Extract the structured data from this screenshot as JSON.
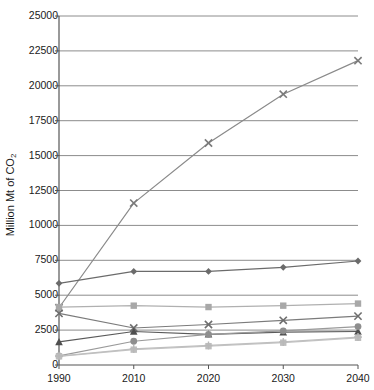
{
  "chart_data": {
    "type": "line",
    "title": "",
    "xlabel": "",
    "ylabel": "Million Mt of CO2",
    "ylabel_rich": "Million Mt of CO₂",
    "categories": [
      "1990",
      "2010",
      "2020",
      "2030",
      "2040"
    ],
    "x": [
      1990,
      2010,
      2020,
      2030,
      2040
    ],
    "ylim": [
      0,
      25000
    ],
    "ytick_labels": [
      "0",
      "2500",
      "5000",
      "7500",
      "10000",
      "12500",
      "15000",
      "17500",
      "20000",
      "22500",
      "25000"
    ],
    "ytick_values": [
      0,
      2500,
      5000,
      7500,
      10000,
      12500,
      15000,
      17500,
      20000,
      22500,
      25000
    ],
    "grid": true,
    "grid_axis": "y",
    "legend": "none",
    "legend_position": "none",
    "series": [
      {
        "name": "series-x-rising",
        "marker": "x",
        "color": "#7a7a7a",
        "line_color": "#8a8a8a",
        "values": [
          4100,
          11600,
          15900,
          19400,
          21800
        ]
      },
      {
        "name": "series-diamond",
        "marker": "diamond",
        "color": "#6b6b6b",
        "line_color": "#6b6b6b",
        "values": [
          5850,
          6700,
          6700,
          7000,
          7450
        ]
      },
      {
        "name": "series-square-light",
        "marker": "square",
        "color": "#a8a8a8",
        "line_color": "#b0b0b0",
        "values": [
          4150,
          4250,
          4150,
          4250,
          4400
        ]
      },
      {
        "name": "series-x-lower",
        "marker": "x",
        "color": "#6e6e6e",
        "line_color": "#7b7b7b",
        "values": [
          3700,
          2650,
          2900,
          3200,
          3500
        ]
      },
      {
        "name": "series-triangle",
        "marker": "triangle",
        "color": "#4f4f4f",
        "line_color": "#5a5a5a",
        "values": [
          1650,
          2400,
          2200,
          2350,
          2400
        ]
      },
      {
        "name": "series-circle",
        "marker": "circle",
        "color": "#8e8e8e",
        "line_color": "#9a9a9a",
        "values": [
          650,
          1700,
          2200,
          2450,
          2750
        ]
      },
      {
        "name": "series-square-pale",
        "marker": "square",
        "color": "#bdbdbd",
        "line_color": "#c4c4c4",
        "values": [
          620,
          1100,
          1350,
          1600,
          1950
        ]
      },
      {
        "name": "series-plus-faint",
        "marker": "plus",
        "color": "#b8b8b8",
        "line_color": "#bfbfbf",
        "values": [
          640,
          1150,
          1400,
          1650,
          2000
        ]
      }
    ]
  },
  "axes": {
    "plot_left": 59,
    "plot_right": 358,
    "plot_top": 16,
    "plot_bottom": 365,
    "axis_color": "#555555",
    "grid_color": "#8c8c8c",
    "background": "#ffffff"
  }
}
